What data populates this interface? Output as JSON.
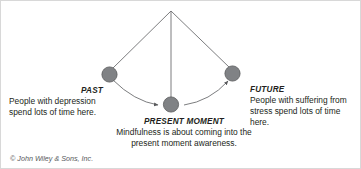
{
  "figure": {
    "alt_title": "Past, Present Moment, Future mindfulness diagram",
    "background_color": "#ffffff",
    "border_color": "#d8d8d8"
  },
  "nodes": {
    "past": {
      "title": "PAST",
      "description_line1": "People with depression",
      "description_line2": "spend lots of time here.",
      "color": "#808285"
    },
    "present": {
      "title": "PRESENT MOMENT",
      "description_line1": "Mindfulness is about coming into the",
      "description_line2": "present moment awareness.",
      "color": "#808285"
    },
    "future": {
      "title": "FUTURE",
      "description_line1": "People with suffering from",
      "description_line2": "stress spend lots of time here.",
      "color": "#808285"
    }
  },
  "lines": {
    "stroke_color": "#6d6e71",
    "apex_label": ""
  },
  "credit": {
    "text": "© John Wiley & Sons, Inc."
  }
}
